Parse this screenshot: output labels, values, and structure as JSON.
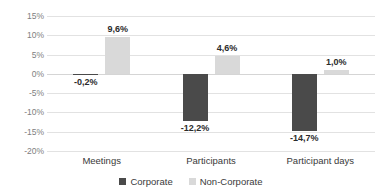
{
  "chart_data": {
    "type": "bar",
    "title": "",
    "subtitle": "",
    "xlabel": "",
    "ylabel": "",
    "categories": [
      "Meetings",
      "Participants",
      "Participant days"
    ],
    "series": [
      {
        "name": "Corporate",
        "color": "#4a4a4a",
        "values": [
          -0.2,
          -12.2,
          -14.7
        ],
        "labels": [
          "-0,2%",
          "-12,2%",
          "-14,7%"
        ]
      },
      {
        "name": "Non-Corporate",
        "color": "#d9d9d9",
        "values": [
          9.6,
          4.6,
          1.0
        ],
        "labels": [
          "9,6%",
          "4,6%",
          "1,0%"
        ]
      }
    ],
    "ylim": [
      -20,
      15
    ],
    "ytick_values": [
      15,
      10,
      5,
      0,
      -5,
      -10,
      -15,
      -20
    ],
    "ytick_labels": [
      "15%",
      "10%",
      "5%",
      "0%",
      "-5%",
      "-10%",
      "-15%",
      "-20%"
    ],
    "grid": true,
    "legend_position": "bottom",
    "value_suffix": "%",
    "decimal_separator": ","
  },
  "legend": {
    "items": [
      {
        "label": "Corporate",
        "swatch_name": "legend-swatch-corporate"
      },
      {
        "label": "Non-Corporate",
        "swatch_name": "legend-swatch-non-corporate"
      }
    ]
  }
}
